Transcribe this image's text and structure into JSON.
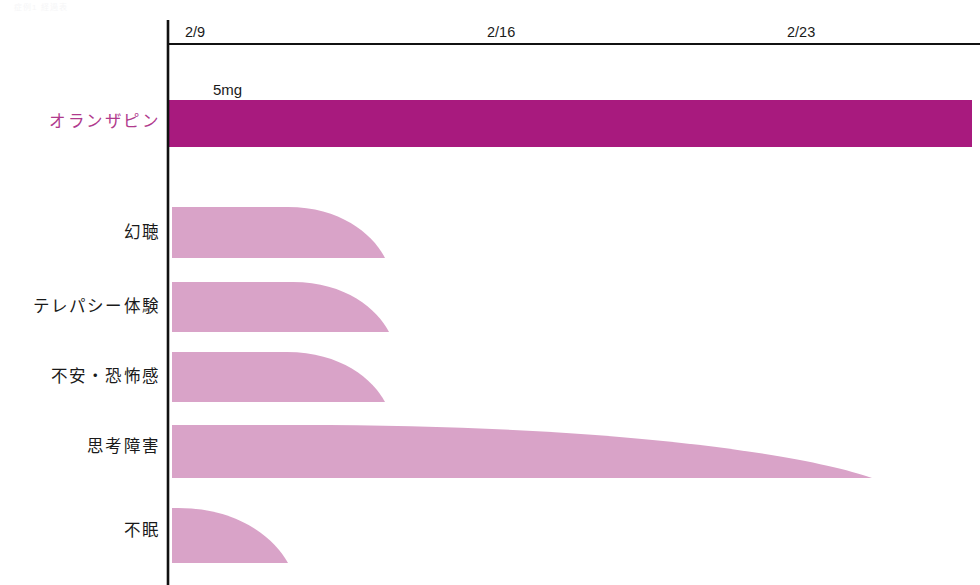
{
  "meta": {
    "faint_top_text": "症例1 経過表"
  },
  "colors": {
    "drug_bar": "#a81a7e",
    "symptom_bar": "#d9a3c8",
    "axis": "#111111",
    "drug_label_text": "#b03a8d",
    "text": "#1a1a1a",
    "background": "#ffffff"
  },
  "axis": {
    "name": "date-axis",
    "ticks": [
      {
        "label": "2/9",
        "x": 168
      },
      {
        "label": "2/16",
        "x": 470
      },
      {
        "label": "2/23",
        "x": 770
      }
    ],
    "line_y": 44,
    "origin_x": 168,
    "end_x": 980,
    "vertical_top": 20,
    "vertical_bottom": 585
  },
  "annotations": [
    {
      "name": "dose-label",
      "text": "5mg",
      "x": 213,
      "y": 95
    }
  ],
  "chart_data": {
    "type": "area",
    "title": "",
    "subtitle": "",
    "xlabel": "",
    "ylabel": "",
    "x_tick_labels": [
      "2/9",
      "2/16",
      "2/23"
    ],
    "grid": false,
    "legend": "none",
    "rows": [
      {
        "label": "オランザピン",
        "kind": "medication",
        "dose": "5mg",
        "color": "#a81a7e",
        "shape": "rectangle",
        "start_x": 168,
        "end_x": 972,
        "top_y": 100,
        "bottom_y": 147,
        "label_y": 127,
        "taper_start_x": 972,
        "intensity": "constant"
      },
      {
        "label": "幻聴",
        "kind": "symptom",
        "color": "#d9a3c8",
        "shape": "tapered",
        "start_x": 172,
        "end_x": 385,
        "top_y": 207,
        "bottom_y": 258,
        "label_y": 238,
        "taper_start_x": 288,
        "intensity": "declining"
      },
      {
        "label": "テレパシー体験",
        "kind": "symptom",
        "color": "#d9a3c8",
        "shape": "tapered",
        "start_x": 172,
        "end_x": 389,
        "top_y": 282,
        "bottom_y": 332,
        "label_y": 312,
        "taper_start_x": 293,
        "intensity": "declining"
      },
      {
        "label": "不安・恐怖感",
        "kind": "symptom",
        "color": "#d9a3c8",
        "shape": "tapered",
        "start_x": 172,
        "end_x": 385,
        "top_y": 352,
        "bottom_y": 402,
        "label_y": 382,
        "taper_start_x": 287,
        "intensity": "declining"
      },
      {
        "label": "思考障害",
        "kind": "symptom",
        "color": "#d9a3c8",
        "shape": "tapered",
        "start_x": 172,
        "end_x": 872,
        "top_y": 425,
        "bottom_y": 478,
        "label_y": 452,
        "taper_start_x": 300,
        "intensity": "slow-declining"
      },
      {
        "label": "不眠",
        "kind": "symptom",
        "color": "#d9a3c8",
        "shape": "tapered",
        "start_x": 172,
        "end_x": 288,
        "top_y": 508,
        "bottom_y": 563,
        "label_y": 536,
        "taper_start_x": 178,
        "intensity": "rapid-declining"
      }
    ]
  }
}
